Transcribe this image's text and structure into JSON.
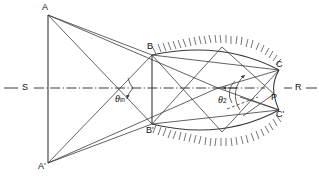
{
  "figure": {
    "type": "optical-ray-diagram",
    "background_color": "#ffffff",
    "line_color": "#3a3a3a",
    "hatch_color": "#3a3a3a"
  },
  "labels": {
    "source_top": "A",
    "source_bottom": "A'",
    "aperture_top": "B",
    "aperture_bottom": "B'",
    "cavity_top": "C",
    "cavity_bottom": "C'",
    "exit_point": "P",
    "axis_left": "S",
    "axis_right": "R",
    "angle_in": "θ",
    "angle_in_sub": "in",
    "angle_two": "θ",
    "angle_two_sub": "2"
  },
  "geometry": {
    "axis_y": 88,
    "source_plane_x": 48,
    "source_top_y": 15,
    "source_bottom_y": 163,
    "aperture_x": 152,
    "aperture_top_y": 55,
    "aperture_bottom_y": 124,
    "cavity_top_point": [
      279,
      70
    ],
    "cavity_bottom_point": [
      279,
      110
    ],
    "exit_point": [
      274,
      94
    ],
    "cavity_apex_x": 222,
    "cavity_apex_top_y": 47,
    "cavity_apex_bottom_y": 132,
    "focus_point": [
      218,
      88
    ]
  }
}
